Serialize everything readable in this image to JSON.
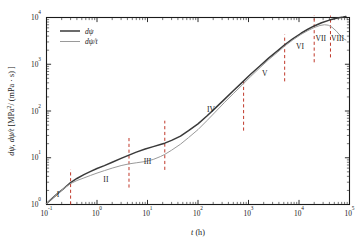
{
  "chart_data": {
    "type": "line",
    "title": "",
    "xlabel": "t (h)",
    "xlabel_italic": "t",
    "xlabel_unit": "(h)",
    "ylabel": "dψ, dψ/t [MPa²/ (mPa · s) ]",
    "xscale": "log",
    "yscale": "log",
    "xlim": [
      0.1,
      100000
    ],
    "ylim": [
      1,
      10000
    ],
    "grid": false,
    "legend_position": "upper-left",
    "x_tick_labels": [
      "10⁻¹",
      "10⁰",
      "10¹",
      "10²",
      "10³",
      "10⁴",
      "10⁵"
    ],
    "x_tick_values": [
      0.1,
      1,
      10,
      100,
      1000,
      10000,
      100000
    ],
    "x_tick_mantissas": [
      "10",
      "10",
      "10",
      "10",
      "10",
      "10",
      "10"
    ],
    "x_tick_exponents": [
      "-1",
      "0",
      "1",
      "2",
      "3",
      "4",
      "5"
    ],
    "y_tick_labels": [
      "10⁰",
      "10¹",
      "10²",
      "10³",
      "10⁴"
    ],
    "y_tick_values": [
      1,
      10,
      100,
      1000,
      10000
    ],
    "y_tick_mantissas": [
      "10",
      "10",
      "10",
      "10",
      "10"
    ],
    "y_tick_exponents": [
      "0",
      "1",
      "2",
      "3",
      "4"
    ],
    "series": [
      {
        "name": "dψ",
        "color": "#3a3a3a",
        "width": 1.5,
        "points": [
          [
            0.1,
            1.05
          ],
          [
            0.13,
            1.35
          ],
          [
            0.17,
            1.75
          ],
          [
            0.22,
            2.2
          ],
          [
            0.3,
            2.95
          ],
          [
            0.4,
            3.6
          ],
          [
            0.55,
            4.35
          ],
          [
            0.75,
            5.1
          ],
          [
            1.0,
            5.9
          ],
          [
            1.4,
            6.8
          ],
          [
            2.0,
            8.0
          ],
          [
            3.0,
            9.7
          ],
          [
            4.3,
            11.4
          ],
          [
            6.0,
            13.2
          ],
          [
            9.0,
            15.4
          ],
          [
            13.0,
            17.3
          ],
          [
            18.0,
            19.2
          ],
          [
            22.0,
            20.5
          ],
          [
            30.0,
            23.5
          ],
          [
            45.0,
            29.0
          ],
          [
            65.0,
            38.0
          ],
          [
            100.0,
            53.0
          ],
          [
            150.0,
            78.0
          ],
          [
            220.0,
            115.0
          ],
          [
            330.0,
            175.0
          ],
          [
            500.0,
            270.0
          ],
          [
            750.0,
            410.0
          ],
          [
            1100.0,
            610.0
          ],
          [
            1700.0,
            930.0
          ],
          [
            2500.0,
            1350.0
          ],
          [
            3800.0,
            1950.0
          ],
          [
            5200.0,
            2600.0
          ],
          [
            7500.0,
            3500.0
          ],
          [
            11000.0,
            4600.0
          ],
          [
            15000.0,
            5600.0
          ],
          [
            20000.0,
            6600.0
          ],
          [
            28000.0,
            7700.0
          ],
          [
            40000.0,
            8800.0
          ],
          [
            55000.0,
            9600.0
          ],
          [
            75000.0,
            10200.0
          ],
          [
            85000.0,
            10500.0
          ]
        ]
      },
      {
        "name": "dψ/t",
        "color": "#9a9a9a",
        "width": 1.0,
        "points": [
          [
            0.1,
            1.05
          ],
          [
            0.13,
            1.35
          ],
          [
            0.17,
            1.75
          ],
          [
            0.22,
            2.2
          ],
          [
            0.3,
            2.8
          ],
          [
            0.4,
            3.25
          ],
          [
            0.55,
            3.7
          ],
          [
            0.75,
            4.2
          ],
          [
            1.0,
            4.7
          ],
          [
            1.4,
            5.3
          ],
          [
            2.0,
            6.0
          ],
          [
            3.0,
            6.8
          ],
          [
            4.3,
            7.4
          ],
          [
            6.0,
            7.8
          ],
          [
            9.0,
            8.3
          ],
          [
            13.0,
            9.2
          ],
          [
            18.0,
            10.6
          ],
          [
            22.0,
            11.8
          ],
          [
            30.0,
            14.5
          ],
          [
            45.0,
            19.5
          ],
          [
            65.0,
            27.0
          ],
          [
            100.0,
            40.0
          ],
          [
            150.0,
            62.0
          ],
          [
            220.0,
            95.0
          ],
          [
            330.0,
            150.0
          ],
          [
            500.0,
            235.0
          ],
          [
            750.0,
            360.0
          ],
          [
            1100.0,
            545.0
          ],
          [
            1700.0,
            850.0
          ],
          [
            2500.0,
            1250.0
          ],
          [
            3800.0,
            1820.0
          ],
          [
            5200.0,
            2450.0
          ],
          [
            7500.0,
            3300.0
          ],
          [
            11000.0,
            4350.0
          ],
          [
            15000.0,
            5250.0
          ],
          [
            20000.0,
            6100.0
          ],
          [
            26000.0,
            6750.0
          ],
          [
            32000.0,
            7000.0
          ],
          [
            38000.0,
            6850.0
          ],
          [
            45000.0,
            6200.0
          ],
          [
            55000.0,
            5100.0
          ],
          [
            65000.0,
            4150.0
          ],
          [
            75000.0,
            3550.0
          ],
          [
            85000.0,
            3300.0
          ]
        ]
      }
    ],
    "region_dividers": [
      {
        "x": 0.3
      },
      {
        "x": 4.3
      },
      {
        "x": 22.0
      },
      {
        "x": 800.0
      },
      {
        "x": 5200.0
      },
      {
        "x": 20000.0
      },
      {
        "x": 42000.0
      }
    ],
    "region_labels": [
      {
        "label": "I",
        "x": 0.17,
        "y": 1.45
      },
      {
        "label": "II",
        "x": 1.5,
        "y": 3.0
      },
      {
        "label": "III",
        "x": 10.0,
        "y": 7.5
      },
      {
        "label": "IV",
        "x": 180.0,
        "y": 95.0
      },
      {
        "label": "V",
        "x": 2100.0,
        "y": 560.0
      },
      {
        "label": "VI",
        "x": 10500.0,
        "y": 2150.0
      },
      {
        "label": "VII",
        "x": 27000.0,
        "y": 3200.0
      },
      {
        "label": "VIII",
        "x": 58000.0,
        "y": 3200.0
      }
    ],
    "colors": {
      "series_primary": "#3a3a3a",
      "series_secondary": "#9a9a9a",
      "divider": "#c0392b",
      "axis": "#1a1a1a",
      "background": "#ffffff"
    }
  },
  "legend": {
    "entries": [
      {
        "label": "dψ"
      },
      {
        "label": "dψ/t"
      }
    ]
  },
  "axes": {
    "x_title_symbol": "t",
    "x_title_unit": "(h)",
    "y_title_full": "dψ, dψ/t [MPa²/ (mPa · s) ]",
    "y_title_part1": "dψ, dψ/",
    "y_title_part2": "t",
    "y_title_part3": " [MPa",
    "y_title_exp": "2",
    "y_title_part4": "/ (mPa · s) ]"
  }
}
